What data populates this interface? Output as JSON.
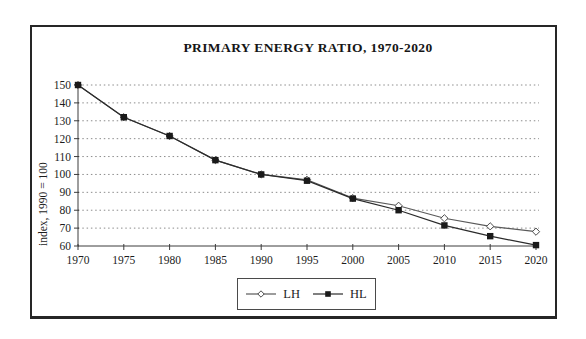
{
  "figure": {
    "title": "PRIMARY ENERGY RATIO, 1970-2020"
  },
  "chart_data": {
    "type": "line",
    "title": "PRIMARY ENERGY RATIO, 1970-2020",
    "xlabel": "",
    "ylabel": "index, 1990 = 100",
    "x": [
      1970,
      1975,
      1980,
      1985,
      1990,
      1995,
      2000,
      2005,
      2010,
      2015,
      2020
    ],
    "x_tick_labels": [
      "1970",
      "1975",
      "1980",
      "1985",
      "1990",
      "1995",
      "2000",
      "2005",
      "2010",
      "2015",
      "2020"
    ],
    "ylim": [
      60,
      150
    ],
    "y_ticks": [
      60,
      70,
      80,
      90,
      100,
      110,
      120,
      130,
      140,
      150
    ],
    "grid": "horizontal-dotted",
    "legend_position": "bottom-center-boxed",
    "series": [
      {
        "name": "LH",
        "marker": "diamond-open",
        "line_color": "#5a5a5a",
        "marker_stroke": "#4a4a4a",
        "marker_fill": "#ffffff",
        "values": [
          150,
          132,
          121.5,
          108,
          100,
          97,
          86.8,
          82.5,
          75.5,
          71,
          68
        ]
      },
      {
        "name": "HL",
        "marker": "square-filled",
        "line_color": "#2b2b2b",
        "marker_stroke": "#1a1a1a",
        "marker_fill": "#1a1a1a",
        "values": [
          150,
          132,
          121.5,
          108,
          100,
          96.5,
          86.5,
          80,
          71.5,
          65.5,
          60.5
        ]
      }
    ]
  },
  "colors": {
    "background": "#ffffff",
    "frame": "#262626",
    "grid": "#8c8c8c",
    "axis": "#3c3c3c",
    "ink": "#1c1c1c"
  }
}
